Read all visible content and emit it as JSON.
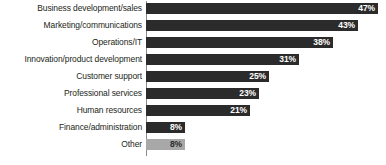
{
  "chart_data": {
    "type": "bar",
    "orientation": "horizontal",
    "title": "",
    "subtitle": "",
    "xlabel": "",
    "ylabel": "",
    "xlim": [
      0,
      48
    ],
    "grid": false,
    "legend": null,
    "value_suffix": "%",
    "categories": [
      "Business development/sales",
      "Marketing/communications",
      "Operations/IT",
      "Innovation/product development",
      "Customer support",
      "Professional services",
      "Human resources",
      "Finance/administration",
      "Other"
    ],
    "values": [
      47,
      43,
      38,
      31,
      25,
      23,
      21,
      8,
      8
    ],
    "data_labels": [
      "47%",
      "43%",
      "38%",
      "31%",
      "25%",
      "23%",
      "21%",
      "8%",
      "8%"
    ],
    "bar_colors": [
      "#2b2b2b",
      "#2b2b2b",
      "#2b2b2b",
      "#2b2b2b",
      "#2b2b2b",
      "#2b2b2b",
      "#2b2b2b",
      "#2b2b2b",
      "#a8a8a8"
    ],
    "label_colors": [
      "#ffffff",
      "#ffffff",
      "#ffffff",
      "#ffffff",
      "#ffffff",
      "#ffffff",
      "#ffffff",
      "#ffffff",
      "#2b2b2b"
    ]
  },
  "style": {
    "background": "#ffffff",
    "axis_color": "#8a8a8a",
    "category_text_color": "#231f20",
    "primary_bar_color": "#2b2b2b",
    "accent_bar_color": "#a8a8a8"
  },
  "layout": {
    "px_per_percent": 4.93,
    "bar_height_px": 11,
    "row_pitch_px": 17,
    "first_bar_top_px": 3,
    "plot_left_px": 146,
    "label_column_width_px": 142
  }
}
